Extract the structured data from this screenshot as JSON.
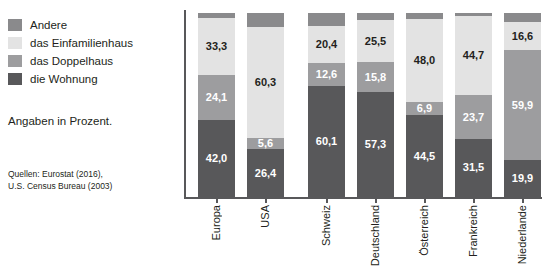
{
  "legend": {
    "items": [
      {
        "label": "Andere",
        "color": "#8a8a8c",
        "key": "andere"
      },
      {
        "label": "das Einfamilienhaus",
        "color": "#e3e3e3",
        "key": "einfamilienhaus"
      },
      {
        "label": "das Doppelhaus",
        "color": "#9d9d9f",
        "key": "doppelhaus"
      },
      {
        "label": "die Wohnung",
        "color": "#58585a",
        "key": "wohnung"
      }
    ]
  },
  "note": "Angaben in Prozent.",
  "sources": {
    "line1": "Quellen: Eurostat (2016),",
    "line2": "U.S. Census Bureau (2003)"
  },
  "colors": {
    "andere": "#8a8a8c",
    "einfamilienhaus": "#e3e3e3",
    "doppelhaus": "#9d9d9f",
    "wohnung": "#58585a",
    "axis": "#58585a",
    "text_dark": "#231f20",
    "text_light": "#ffffff"
  },
  "chart_data": {
    "type": "bar",
    "title": "",
    "subtitle": "Angaben in Prozent.",
    "xlabel": "",
    "ylabel": "",
    "ylim": [
      0,
      100
    ],
    "stacked": true,
    "grid": false,
    "legend_position": "left",
    "categories": [
      "Europa",
      "USA",
      "Schweiz",
      "Deutschland",
      "Österreich",
      "Frankreich",
      "Niederlande"
    ],
    "groups": [
      [
        "Europa",
        "USA"
      ],
      [
        "Schweiz",
        "Deutschland",
        "Österreich",
        "Frankreich",
        "Niederlande"
      ]
    ],
    "series": [
      {
        "name": "die Wohnung",
        "key": "wohnung",
        "values": [
          42.0,
          26.4,
          60.1,
          57.3,
          44.5,
          31.5,
          19.9
        ]
      },
      {
        "name": "das Doppelhaus",
        "key": "doppelhaus",
        "values": [
          24.1,
          5.6,
          12.6,
          15.8,
          6.9,
          23.7,
          59.9
        ]
      },
      {
        "name": "das Einfamilienhaus",
        "key": "einfamilienhaus",
        "values": [
          33.3,
          60.3,
          20.4,
          25.5,
          48.0,
          44.7,
          16.6
        ]
      },
      {
        "name": "Andere",
        "key": "andere",
        "values": [
          2.6,
          7.7,
          6.9,
          1.4,
          0.6,
          0.1,
          3.6
        ]
      }
    ],
    "value_labels": [
      {
        "category": "Europa",
        "labels": [
          "42,0",
          "24,1",
          "33,3"
        ]
      },
      {
        "category": "USA",
        "labels": [
          "26,4",
          "5,6",
          "60,3"
        ]
      },
      {
        "category": "Schweiz",
        "labels": [
          "60,1",
          "12,6",
          "20,4"
        ]
      },
      {
        "category": "Deutschland",
        "labels": [
          "57,3",
          "15,8",
          "25,5"
        ]
      },
      {
        "category": "Österreich",
        "labels": [
          "44,5",
          "6,9",
          "48,0"
        ]
      },
      {
        "category": "Frankreich",
        "labels": [
          "31,5",
          "23,7",
          "44,7"
        ]
      },
      {
        "category": "Niederlande",
        "labels": [
          "19,9",
          "59,9",
          "16,6"
        ]
      }
    ]
  },
  "bars": [
    {
      "name": "Europa",
      "x": 16,
      "segments": [
        {
          "key": "andere",
          "pct": 2.6,
          "label": "",
          "label_color": "#231f20"
        },
        {
          "key": "einfamilienhaus",
          "pct": 31.3,
          "label": "33,3",
          "label_color": "#231f20"
        },
        {
          "key": "doppelhaus",
          "pct": 24.1,
          "label": "24,1",
          "label_color": "#ffffff"
        },
        {
          "key": "wohnung",
          "pct": 42.0,
          "label": "42,0",
          "label_color": "#ffffff"
        }
      ]
    },
    {
      "name": "USA",
      "x": 65,
      "segments": [
        {
          "key": "andere",
          "pct": 7.7,
          "label": "",
          "label_color": "#231f20"
        },
        {
          "key": "einfamilienhaus",
          "pct": 60.3,
          "label": "60,3",
          "label_color": "#231f20"
        },
        {
          "key": "doppelhaus",
          "pct": 5.6,
          "label": "5,6",
          "label_color": "#ffffff"
        },
        {
          "key": "wohnung",
          "pct": 26.4,
          "label": "26,4",
          "label_color": "#ffffff"
        }
      ]
    },
    {
      "name": "Schweiz",
      "x": 126,
      "segments": [
        {
          "key": "andere",
          "pct": 6.9,
          "label": "",
          "label_color": "#231f20"
        },
        {
          "key": "einfamilienhaus",
          "pct": 20.4,
          "label": "20,4",
          "label_color": "#231f20"
        },
        {
          "key": "doppelhaus",
          "pct": 12.6,
          "label": "12,6",
          "label_color": "#ffffff"
        },
        {
          "key": "wohnung",
          "pct": 60.1,
          "label": "60,1",
          "label_color": "#ffffff"
        }
      ]
    },
    {
      "name": "Deutschland",
      "x": 175,
      "segments": [
        {
          "key": "andere",
          "pct": 3.8,
          "label": "",
          "label_color": "#231f20"
        },
        {
          "key": "einfamilienhaus",
          "pct": 23.1,
          "label": "25,5",
          "label_color": "#231f20"
        },
        {
          "key": "doppelhaus",
          "pct": 15.8,
          "label": "15,8",
          "label_color": "#ffffff"
        },
        {
          "key": "wohnung",
          "pct": 57.3,
          "label": "57,3",
          "label_color": "#ffffff"
        }
      ]
    },
    {
      "name": "Österreich",
      "x": 224,
      "segments": [
        {
          "key": "andere",
          "pct": 3.0,
          "label": "",
          "label_color": "#231f20"
        },
        {
          "key": "einfamilienhaus",
          "pct": 45.6,
          "label": "48,0",
          "label_color": "#231f20"
        },
        {
          "key": "doppelhaus",
          "pct": 6.9,
          "label": "6,9",
          "label_color": "#ffffff"
        },
        {
          "key": "wohnung",
          "pct": 44.5,
          "label": "44,5",
          "label_color": "#ffffff"
        }
      ]
    },
    {
      "name": "Frankreich",
      "x": 273,
      "segments": [
        {
          "key": "andere",
          "pct": 1.6,
          "label": "",
          "label_color": "#231f20"
        },
        {
          "key": "einfamilienhaus",
          "pct": 43.2,
          "label": "44,7",
          "label_color": "#231f20"
        },
        {
          "key": "doppelhaus",
          "pct": 23.7,
          "label": "23,7",
          "label_color": "#ffffff"
        },
        {
          "key": "wohnung",
          "pct": 31.5,
          "label": "31,5",
          "label_color": "#ffffff"
        }
      ]
    },
    {
      "name": "Niederlande",
      "x": 322,
      "segments": [
        {
          "key": "andere",
          "pct": 5.0,
          "label": "",
          "label_color": "#231f20"
        },
        {
          "key": "einfamilienhaus",
          "pct": 15.2,
          "label": "16,6",
          "label_color": "#231f20"
        },
        {
          "key": "doppelhaus",
          "pct": 59.9,
          "label": "59,9",
          "label_color": "#ffffff"
        },
        {
          "key": "wohnung",
          "pct": 19.9,
          "label": "19,9",
          "label_color": "#ffffff"
        }
      ]
    }
  ]
}
